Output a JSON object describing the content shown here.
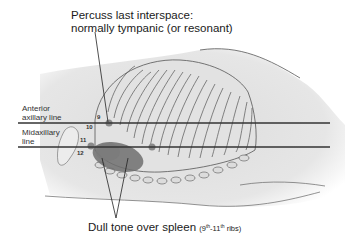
{
  "figure": {
    "title_label": {
      "line1": "Percuss last interspace:",
      "line2": "normally tympanic (or resonant)"
    },
    "bottom_label": {
      "main": "Dull tone over spleen",
      "paren_open": "(9",
      "sup1": "th",
      "dash": "-11",
      "sup2": "th",
      "paren_close": " ribs)"
    },
    "reference_lines": [
      {
        "label_line1": "Anterior",
        "label_line2": "axillary line"
      },
      {
        "label_line1": "Midaxillary",
        "label_line2": "line"
      }
    ],
    "rib_numbers": [
      "9",
      "10",
      "11",
      "12"
    ],
    "colors": {
      "body_fill": "#e6e6e6",
      "outline": "#555555",
      "reference_line": "#333333",
      "spleen": "#6f6f6f",
      "percussion_spot": "#8a8a8a"
    }
  }
}
